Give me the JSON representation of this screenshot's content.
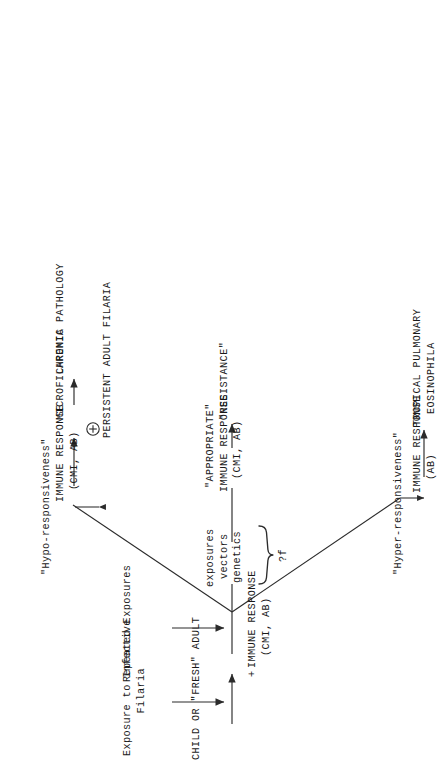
{
  "diagram": {
    "orientation": "rotated-90-ccw",
    "ink_color": "#1a1a1a",
    "nodes": {
      "start": "CHILD OR \"FRESH\" ADULT",
      "primary_response_plus": "+",
      "primary_response": "IMMUNE RESPONSE",
      "primary_response_sub": "(CMI, AB)",
      "exposure_label_line1": "Exposure to Infective",
      "exposure_label_line2": "Filaria",
      "repeated_exposures": "Repeated Exposures",
      "factor_1": "exposures",
      "factor_2": "vectors",
      "factor_3": "genetics",
      "factor_condition": "?f",
      "hypo_label": "\"Hypo-responsiveness\"",
      "hyper_label": "\"Hyper-responsiveness\"",
      "hypo_response_arrow": "↓",
      "hypo_response": "IMMUNE RESPONSE",
      "hypo_response_sub": "(CMI, AB)",
      "hypo_outcome_symbol": "⊕",
      "hypo_outcome_line1": "MICROFILAREMIA",
      "hypo_outcome_line2": "PERSISTENT ADULT FILARIA",
      "hypo_end": "CHRONIC PATHOLOGY",
      "mid_response_title": "\"APPROPRIATE\"",
      "mid_response": "IMMUNE RESPONSE",
      "mid_response_sub": "(CMI, AB)",
      "mid_end": "\"RESISTANCE\"",
      "hyper_response_arrow": "↑",
      "hyper_response": "IMMUNE RESPONSE",
      "hyper_response_sub": "(AB)",
      "hyper_end_line1": "TROPICAL PULMONARY",
      "hyper_end_line2": "EOSINOPHILA"
    }
  }
}
